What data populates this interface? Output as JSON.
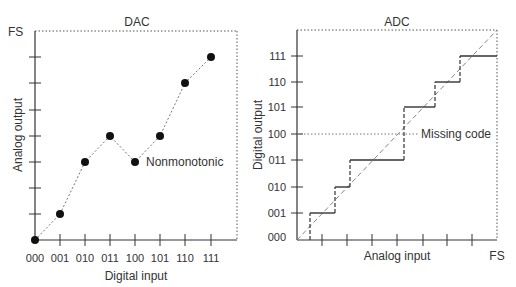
{
  "dac": {
    "title": "DAC",
    "y_top_label": "FS",
    "x_axis_label": "Digital input",
    "y_axis_label": "Analog output",
    "x_ticks": [
      "000",
      "001",
      "010",
      "011",
      "100",
      "101",
      "110",
      "111"
    ],
    "annotation": "Nonmonotonic",
    "points_code_to_level": [
      {
        "code": "000",
        "level": 0
      },
      {
        "code": "001",
        "level": 1
      },
      {
        "code": "010",
        "level": 3
      },
      {
        "code": "011",
        "level": 4
      },
      {
        "code": "100",
        "level": 3
      },
      {
        "code": "101",
        "level": 4
      },
      {
        "code": "110",
        "level": 6
      },
      {
        "code": "111",
        "level": 7
      }
    ],
    "y_levels_to_FS": 8
  },
  "adc": {
    "title": "ADC",
    "x_right_label": "FS",
    "x_axis_label": "Analog input",
    "y_axis_label": "Digital output",
    "y_ticks": [
      "000",
      "001",
      "010",
      "011",
      "100",
      "101",
      "110",
      "111"
    ],
    "annotation": "Missing code",
    "missing_code": "100",
    "staircase_output_codes": [
      "000",
      "001",
      "010",
      "011",
      "101",
      "110",
      "111"
    ],
    "ideal_line": "diagonal dashed from origin to FS"
  },
  "colors": {
    "ink": "#333333",
    "dotted": "#666666"
  }
}
